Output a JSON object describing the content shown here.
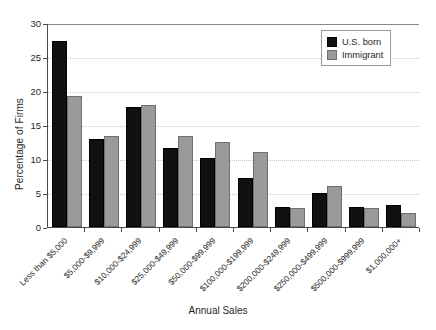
{
  "chart_data": {
    "type": "bar",
    "title": "",
    "xlabel": "Annual Sales",
    "ylabel": "Percentage of Firms",
    "ylim": [
      0,
      30
    ],
    "yticks": [
      0,
      5,
      10,
      15,
      20,
      25,
      30
    ],
    "grid": true,
    "legend_position": "top-right",
    "categories": [
      "Less than $5,000",
      "$5,000-$9,999",
      "$10,000-$24,999",
      "$25,000-$49,999",
      "$50,000-$99,999",
      "$100,000-$199,999",
      "$200,000-$249,999",
      "$250,000-$499,999",
      "$500,000-$999,999",
      "$1,000,000+"
    ],
    "series": [
      {
        "name": "U.S. born",
        "color": "#111111",
        "values": [
          27.4,
          12.9,
          17.6,
          11.6,
          10.1,
          7.2,
          2.9,
          5.0,
          2.9,
          3.2
        ]
      },
      {
        "name": "Immigrant",
        "color": "#9a9a9a",
        "values": [
          19.2,
          13.4,
          17.9,
          13.4,
          12.5,
          11.0,
          2.8,
          6.0,
          2.8,
          2.0
        ]
      }
    ]
  },
  "legend": {
    "items": [
      {
        "label": "U.S. born"
      },
      {
        "label": "Immigrant"
      }
    ]
  }
}
